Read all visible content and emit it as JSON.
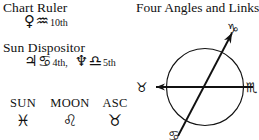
{
  "left_panel": {
    "chart_ruler": {
      "heading": "Chart Ruler",
      "planet_glyph": "♀",
      "planet_name": "venus",
      "sign_glyph": "♒",
      "sign_name": "aquarius",
      "house": "10th"
    },
    "sun_dispositor": {
      "heading": "Sun Dispositor",
      "entries": [
        {
          "planet_glyph": "♃",
          "planet_name": "jupiter",
          "sign_glyph": "♋",
          "sign_name": "cancer",
          "house": "4th,"
        },
        {
          "planet_glyph": "♆",
          "planet_name": "neptune",
          "sign_glyph": "♎",
          "sign_name": "libra",
          "house": "5th"
        }
      ]
    },
    "big_three": [
      {
        "label": "SUN",
        "sign_glyph": "♓",
        "sign_name": "pisces"
      },
      {
        "label": "MOON",
        "sign_glyph": "♌",
        "sign_name": "leo"
      },
      {
        "label": "ASC",
        "sign_glyph": "♉",
        "sign_name": "taurus"
      }
    ]
  },
  "right_panel": {
    "title": "Four Angles and Links",
    "diagram": {
      "markers": [
        {
          "position": "top-right",
          "sign_glyph": "♑",
          "sign_name": "capricorn"
        },
        {
          "position": "bottom-left",
          "sign_glyph": "♋",
          "sign_name": "cancer"
        },
        {
          "position": "left",
          "sign_glyph": "♉",
          "sign_name": "taurus"
        },
        {
          "position": "right",
          "sign_glyph": "♏",
          "sign_name": "scorpio"
        }
      ],
      "axes": [
        {
          "name": "horizontal-axis",
          "arrow_end": "left"
        },
        {
          "name": "diagonal-axis",
          "arrow_end": "top-right"
        }
      ]
    }
  },
  "colors": {
    "ink": "#111111",
    "background": "#ffffff"
  }
}
